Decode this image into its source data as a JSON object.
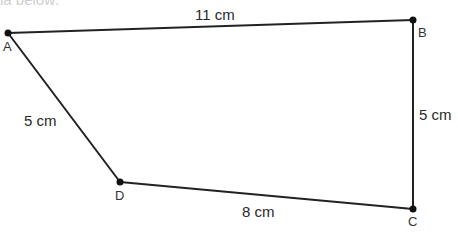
{
  "caption_fragment": "ia below:",
  "diagram": {
    "type": "quadrilateral",
    "stroke_color": "#222222",
    "vertices": [
      {
        "name": "A",
        "x": 8,
        "y": 33
      },
      {
        "name": "B",
        "x": 413,
        "y": 20
      },
      {
        "name": "C",
        "x": 413,
        "y": 209
      },
      {
        "name": "D",
        "x": 120,
        "y": 182
      }
    ],
    "sides": [
      {
        "from": "A",
        "to": "B",
        "label": "11 cm"
      },
      {
        "from": "B",
        "to": "C",
        "label": "5 cm"
      },
      {
        "from": "C",
        "to": "D",
        "label": "8 cm"
      },
      {
        "from": "D",
        "to": "A",
        "label": "5 cm"
      }
    ]
  }
}
